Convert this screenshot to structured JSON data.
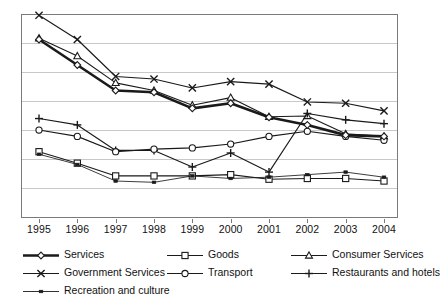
{
  "chart_data": {
    "type": "line",
    "title": "",
    "xlabel": "",
    "ylabel": "",
    "grid": true,
    "legend_position": "bottom",
    "categories": [
      "1995",
      "1996",
      "1997",
      "1998",
      "1999",
      "2000",
      "2001",
      "2002",
      "2003",
      "2004"
    ],
    "x": [
      1995,
      1996,
      1997,
      1998,
      1999,
      2000,
      2001,
      2002,
      2003,
      2004
    ],
    "ylim": [
      0,
      8
    ],
    "yticks": [
      0,
      1,
      2,
      3,
      4,
      5,
      6,
      7,
      8
    ],
    "y_axis_labels_shown": false,
    "series": [
      {
        "name": "Services",
        "marker": "diamond",
        "line_weight": "thick",
        "values": [
          7.0,
          6.0,
          5.0,
          4.93,
          4.3,
          4.5,
          3.95,
          3.65,
          3.25,
          3.2
        ]
      },
      {
        "name": "Goods",
        "marker": "square",
        "line_weight": "normal",
        "values": [
          2.6,
          2.15,
          1.65,
          1.65,
          1.65,
          1.7,
          1.52,
          1.55,
          1.55,
          1.45
        ]
      },
      {
        "name": "Consumer Services",
        "marker": "triangle",
        "line_weight": "normal",
        "values": [
          7.05,
          6.35,
          5.3,
          5.0,
          4.42,
          4.72,
          3.97,
          4.0,
          3.3,
          3.2
        ]
      },
      {
        "name": "Government Services",
        "marker": "x",
        "line_weight": "normal",
        "values": [
          7.95,
          7.0,
          5.55,
          5.45,
          5.1,
          5.35,
          5.25,
          4.55,
          4.5,
          4.2
        ]
      },
      {
        "name": "Transport",
        "marker": "circle",
        "line_weight": "normal",
        "values": [
          3.45,
          3.2,
          2.6,
          2.7,
          2.75,
          2.9,
          3.2,
          3.4,
          3.2,
          3.05
        ]
      },
      {
        "name": "Restaurants and hotels",
        "marker": "plus",
        "line_weight": "normal",
        "values": [
          3.9,
          3.65,
          2.65,
          2.65,
          2.0,
          2.55,
          1.8,
          4.1,
          3.85,
          3.7
        ]
      },
      {
        "name": "Recreation and culture",
        "marker": "small-square",
        "line_weight": "thin",
        "values": [
          2.5,
          2.1,
          1.45,
          1.4,
          1.65,
          1.55,
          1.6,
          1.7,
          1.8,
          1.6
        ]
      }
    ]
  },
  "legend": {
    "items": [
      {
        "label": "Services",
        "marker": "diamond"
      },
      {
        "label": "Goods",
        "marker": "square"
      },
      {
        "label": "Consumer Services",
        "marker": "triangle"
      },
      {
        "label": "Government Services",
        "marker": "x"
      },
      {
        "label": "Transport",
        "marker": "circle"
      },
      {
        "label": "Restaurants and hotels",
        "marker": "plus"
      },
      {
        "label": "Recreation and culture",
        "marker": "small-square"
      }
    ]
  },
  "colors": {
    "line": "#1a1a1a",
    "grid": "#c8c8c8",
    "frame": "#7a7a7a",
    "background": "#ffffff"
  }
}
